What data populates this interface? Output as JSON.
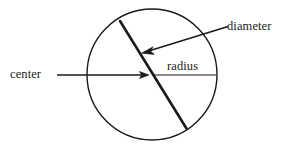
{
  "figure": {
    "background_color": "#ffffff",
    "stroke_color": "#1a1a1a"
  },
  "labels": {
    "center": "center",
    "radius": "radius",
    "diameter": "diameter"
  },
  "geometry": {
    "circle": {
      "cx": 152,
      "cy": 74.5,
      "rx": 65,
      "ry": 65.5,
      "stroke_width": 1.4
    },
    "diameter_chord": {
      "x1": 120,
      "y1": 21,
      "x2": 186.5,
      "y2": 128.5,
      "stroke_width": 2.6
    },
    "radius_segment": {
      "x1": 153,
      "y1": 75,
      "x2": 216,
      "y2": 75,
      "stroke_width": 1.2
    },
    "center_arrow": {
      "x1": 57,
      "y1": 75,
      "x2": 148,
      "y2": 75,
      "stroke_width": 1.3
    },
    "diameter_arrow": {
      "x1": 228,
      "y1": 26.5,
      "x2": 142,
      "y2": 52.5,
      "stroke_width": 1.5
    }
  }
}
